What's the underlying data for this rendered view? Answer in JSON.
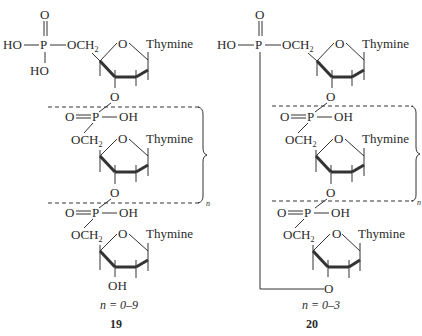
{
  "structures": [
    {
      "id": "19",
      "compound_number": "19",
      "range_label": "n = 0–9",
      "terminal_5_phosphate": {
        "top": "O",
        "left": "HO",
        "center": "P",
        "right": "OCH",
        "right_sub": "2",
        "bottom": "HO"
      },
      "nucleoside_base": "Thymine",
      "ring_oxygen": "O",
      "linker_oxygen": "O",
      "repeat_phosphate": {
        "left": "O",
        "center": "P",
        "right": "OH"
      },
      "repeat_sugar_ch2": "OCH",
      "repeat_sugar_sub": "2",
      "terminal_3": "OH",
      "bracket_subscript": "n"
    },
    {
      "id": "20",
      "compound_number": "20",
      "range_label": "n = 0–3",
      "terminal_5_phosphate": {
        "top": "O",
        "left": "HO",
        "center": "P",
        "right": "OCH",
        "right_sub": "2"
      },
      "nucleoside_base": "Thymine",
      "ring_oxygen": "O",
      "linker_oxygen": "O",
      "repeat_phosphate": {
        "left": "O",
        "center": "P",
        "right": "OH"
      },
      "repeat_sugar_ch2": "OCH",
      "repeat_sugar_sub": "2",
      "terminal_3": "O",
      "bracket_subscript": "n"
    }
  ]
}
